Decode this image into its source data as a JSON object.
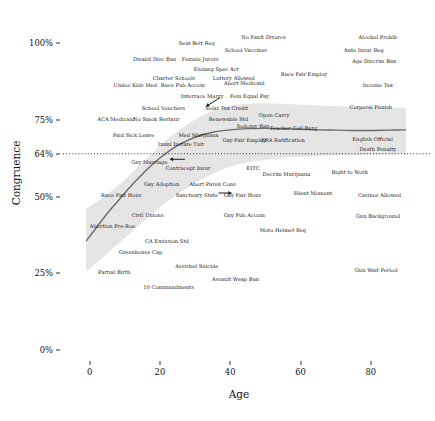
{
  "chart_data": {
    "type": "scatter",
    "title": "",
    "xlabel": "Age",
    "ylabel": "Congruence",
    "xlim": [
      -7,
      92
    ],
    "ylim": [
      0,
      1.06
    ],
    "grid": false,
    "legend": null,
    "xticks": [
      {
        "value": 0,
        "label": "0"
      },
      {
        "value": 20,
        "label": "20"
      },
      {
        "value": 40,
        "label": "40"
      },
      {
        "value": 60,
        "label": "60"
      },
      {
        "value": 80,
        "label": "80"
      }
    ],
    "yticks": [
      {
        "value": 0.0,
        "label": "0%"
      },
      {
        "value": 0.25,
        "label": "25%"
      },
      {
        "value": 0.5,
        "label": "50%"
      },
      {
        "value": 0.64,
        "label": "64%"
      },
      {
        "value": 0.75,
        "label": "75%"
      },
      {
        "value": 1.0,
        "label": "100%"
      }
    ],
    "reference_line": {
      "y": 0.64,
      "style": "dotted",
      "label": "64%"
    },
    "trend_line": {
      "style": "solid",
      "color": "#6b6b6b",
      "points": [
        [
          -1,
          0.355
        ],
        [
          2,
          0.4
        ],
        [
          5,
          0.445
        ],
        [
          8,
          0.485
        ],
        [
          11,
          0.525
        ],
        [
          14,
          0.562
        ],
        [
          17,
          0.596
        ],
        [
          20,
          0.626
        ],
        [
          23,
          0.652
        ],
        [
          26,
          0.673
        ],
        [
          30,
          0.694
        ],
        [
          35,
          0.71
        ],
        [
          40,
          0.718
        ],
        [
          45,
          0.722
        ],
        [
          50,
          0.723
        ],
        [
          55,
          0.722
        ],
        [
          60,
          0.72
        ],
        [
          65,
          0.718
        ],
        [
          70,
          0.717
        ],
        [
          75,
          0.716
        ],
        [
          80,
          0.716
        ],
        [
          85,
          0.717
        ],
        [
          90,
          0.718
        ]
      ]
    },
    "confidence_band": {
      "color": "#e2e2e2",
      "upper": [
        [
          -1,
          0.46
        ],
        [
          4,
          0.5
        ],
        [
          9,
          0.545
        ],
        [
          14,
          0.6
        ],
        [
          19,
          0.655
        ],
        [
          24,
          0.705
        ],
        [
          30,
          0.752
        ],
        [
          36,
          0.785
        ],
        [
          42,
          0.8
        ],
        [
          50,
          0.805
        ],
        [
          60,
          0.8
        ],
        [
          70,
          0.795
        ],
        [
          80,
          0.792
        ],
        [
          90,
          0.79
        ]
      ],
      "lower": [
        [
          -1,
          0.255
        ],
        [
          4,
          0.305
        ],
        [
          9,
          0.355
        ],
        [
          14,
          0.405
        ],
        [
          19,
          0.455
        ],
        [
          24,
          0.5
        ],
        [
          30,
          0.545
        ],
        [
          36,
          0.58
        ],
        [
          42,
          0.605
        ],
        [
          50,
          0.62
        ],
        [
          60,
          0.63
        ],
        [
          70,
          0.635
        ],
        [
          80,
          0.638
        ],
        [
          90,
          0.64
        ]
      ]
    },
    "annotations": [
      {
        "text": "Abort Ultrasound",
        "arrow": "left",
        "x": 36.5,
        "y": 0.622
      },
      {
        "text": "Abort Wait Period",
        "arrow": "right",
        "x": 45.5,
        "y": 0.512
      },
      {
        "text": "Interrace Marry",
        "arrow": "down-right",
        "x": 27.5,
        "y": 0.793
      }
    ],
    "points": [
      {
        "label": "Seat Belt Req",
        "x": 30.5,
        "y": 1.0
      },
      {
        "label": "No Fault Divorce",
        "x": 49.5,
        "y": 1.02
      },
      {
        "label": "Alcohol Prohib",
        "x": 82.0,
        "y": 1.02
      },
      {
        "label": "School Vaccines",
        "x": 44.5,
        "y": 0.978
      },
      {
        "label": "Auto Insur Req",
        "x": 78.0,
        "y": 0.978
      },
      {
        "label": "Disabil Disc Ban",
        "x": 18.5,
        "y": 0.948
      },
      {
        "label": "Female Jurors",
        "x": 31.5,
        "y": 0.948
      },
      {
        "label": "Age Discrim Ban",
        "x": 81.0,
        "y": 0.942
      },
      {
        "label": "Endang Spec Act",
        "x": 36.0,
        "y": 0.915
      },
      {
        "label": "Charter Schools",
        "x": 24.0,
        "y": 0.888
      },
      {
        "label": "Lottery Allowed",
        "x": 41.0,
        "y": 0.888
      },
      {
        "label": "Race Fair Employ",
        "x": 61.0,
        "y": 0.9
      },
      {
        "label": "Undoc Kids Med",
        "x": 13.0,
        "y": 0.865
      },
      {
        "label": "Race Pub Accom",
        "x": 26.5,
        "y": 0.865
      },
      {
        "label": "Abort Medicaid",
        "x": 44.0,
        "y": 0.87
      },
      {
        "label": "Income Tax",
        "x": 82.0,
        "y": 0.865
      },
      {
        "label": "Interrace Marry",
        "x": 32.0,
        "y": 0.83
      },
      {
        "label": "Fem Equal Pay",
        "x": 45.5,
        "y": 0.828
      },
      {
        "label": "School Vouchers",
        "x": 21.0,
        "y": 0.79
      },
      {
        "label": "Solar Tax Credit",
        "x": 39.0,
        "y": 0.79
      },
      {
        "label": "Corporal Punish",
        "x": 80.0,
        "y": 0.793
      },
      {
        "label": "Open Carry",
        "x": 52.5,
        "y": 0.768
      },
      {
        "label": "ACA Medicaid",
        "x": 7.5,
        "y": 0.752
      },
      {
        "label": "No Smok Restaur",
        "x": 19.0,
        "y": 0.752
      },
      {
        "label": "Renewable Std",
        "x": 39.5,
        "y": 0.755
      },
      {
        "label": "Sodomy Ban",
        "x": 46.5,
        "y": 0.73
      },
      {
        "label": "Teacher Coll Barg",
        "x": 58.0,
        "y": 0.723
      },
      {
        "label": "Paid Sick Leave",
        "x": 12.5,
        "y": 0.7
      },
      {
        "label": "Med Marijuana",
        "x": 31.0,
        "y": 0.7
      },
      {
        "label": "Gay-Fair Employ",
        "x": 44.0,
        "y": 0.685
      },
      {
        "label": "ERA Ratification",
        "x": 55.0,
        "y": 0.685
      },
      {
        "label": "English Official",
        "x": 80.5,
        "y": 0.688
      },
      {
        "label": "Immi Instate Tuit",
        "x": 26.0,
        "y": 0.672
      },
      {
        "label": "Death Penalty",
        "x": 82.0,
        "y": 0.655
      },
      {
        "label": "Gay Marriage",
        "x": 17.0,
        "y": 0.612
      },
      {
        "label": "Contracept Insur",
        "x": 28.0,
        "y": 0.592
      },
      {
        "label": "EITC",
        "x": 46.5,
        "y": 0.595
      },
      {
        "label": "Decrim Marijuana",
        "x": 56.0,
        "y": 0.575
      },
      {
        "label": "Right to Work",
        "x": 74.0,
        "y": 0.58
      },
      {
        "label": "Gay Adoption",
        "x": 20.5,
        "y": 0.54
      },
      {
        "label": "Abort Paren Cons",
        "x": 35.0,
        "y": 0.54
      },
      {
        "label": "Race Fair Hous",
        "x": 9.0,
        "y": 0.505
      },
      {
        "label": "Sanctuary State",
        "x": 30.5,
        "y": 0.505
      },
      {
        "label": "Gay Fair Hous",
        "x": 43.5,
        "y": 0.505
      },
      {
        "label": "Silent Moment",
        "x": 63.5,
        "y": 0.512
      },
      {
        "label": "Casinos Allowed",
        "x": 82.5,
        "y": 0.505
      },
      {
        "label": "Civil Unions",
        "x": 16.5,
        "y": 0.44
      },
      {
        "label": "Gay Pub Accom",
        "x": 44.0,
        "y": 0.44
      },
      {
        "label": "Gun Background",
        "x": 82.0,
        "y": 0.438
      },
      {
        "label": "Abortion Pre-Roe",
        "x": 6.5,
        "y": 0.405
      },
      {
        "label": "Moto Helmet Req",
        "x": 55.0,
        "y": 0.39
      },
      {
        "label": "CA Emission Std",
        "x": 22.0,
        "y": 0.355
      },
      {
        "label": "Greenhouse Cap",
        "x": 14.5,
        "y": 0.32
      },
      {
        "label": "Assisted Suicide",
        "x": 30.5,
        "y": 0.275
      },
      {
        "label": "Partial Birth",
        "x": 7.0,
        "y": 0.255
      },
      {
        "label": "Gun Wait Period",
        "x": 81.5,
        "y": 0.262
      },
      {
        "label": "Assault Weap Ban",
        "x": 41.5,
        "y": 0.232
      },
      {
        "label": "10 Commandments",
        "x": 22.5,
        "y": 0.205
      }
    ]
  }
}
